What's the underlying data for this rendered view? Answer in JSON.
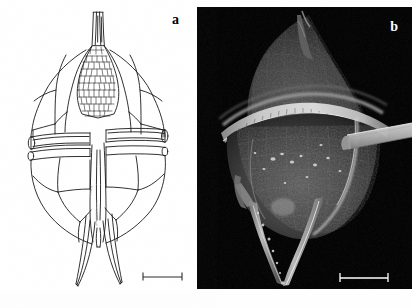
{
  "figure": {
    "panels": [
      {
        "id": "a",
        "label": "a",
        "type": "line-drawing",
        "subject": "Dinoflagellate theca, ventral view, line drawing",
        "scalebar": {
          "present": true,
          "color": "#000000"
        }
      },
      {
        "id": "b",
        "label": "b",
        "type": "sem-micrograph",
        "subject": "Dinoflagellate cell, scanning electron micrograph",
        "background": "#000000",
        "scalebar": {
          "present": true,
          "color": "#ffffff"
        }
      }
    ],
    "caption": "",
    "colors": {
      "page_background": "#ffffff",
      "ink": "#000000",
      "sem_background": "#000000",
      "sem_highlight": "#d8d8d8",
      "label_light": "#ffffff"
    }
  }
}
